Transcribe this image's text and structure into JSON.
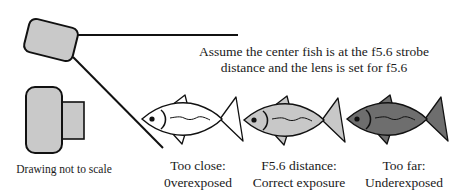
{
  "diagram": {
    "headline_line1": "Assume the center fish is at the f5.6 strobe",
    "headline_line2": "distance and the lens is set for f5.6",
    "note": "Drawing not to scale",
    "components": {
      "strobe": "strobe-head",
      "camera": "camera-body-with-lens",
      "strobe_beam": "light-cone-lines"
    },
    "fish": [
      {
        "position": "near",
        "label_line1": "Too close:",
        "label_line2": "0verexposed",
        "fill": "#ffffff"
      },
      {
        "position": "center",
        "label_line1": "F5.6 distance:",
        "label_line2": "Correct exposure",
        "fill": "#c8c8c8"
      },
      {
        "position": "far",
        "label_line1": "Too far:",
        "label_line2": "Underexposed",
        "fill": "#6e6e6e"
      }
    ],
    "colors": {
      "stroke": "#111111",
      "equipment_fill": "#c9c9c9",
      "background": "#ffffff"
    }
  }
}
